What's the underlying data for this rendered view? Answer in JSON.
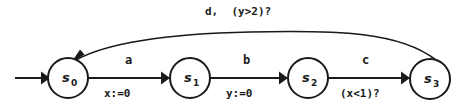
{
  "diagram": {
    "background_color": "#ffffff",
    "stroke_color": "#1a1a1a",
    "states": [
      {
        "id": "s0",
        "base": "s",
        "subscript": "0",
        "cx": 68,
        "cy": 78,
        "r": 20,
        "initial": true
      },
      {
        "id": "s1",
        "base": "s",
        "subscript": "1",
        "cx": 190,
        "cy": 78,
        "r": 20,
        "initial": false
      },
      {
        "id": "s2",
        "base": "s",
        "subscript": "2",
        "cx": 308,
        "cy": 78,
        "r": 20,
        "initial": false
      },
      {
        "id": "s3",
        "base": "s",
        "subscript": "3",
        "cx": 430,
        "cy": 79,
        "r": 20,
        "initial": false
      }
    ],
    "transitions": [
      {
        "id": "t-init",
        "from": null,
        "to": "s0",
        "kind": "initial",
        "action": "",
        "guard": "",
        "assignment": ""
      },
      {
        "id": "t-s0-s1",
        "from": "s0",
        "to": "s1",
        "kind": "straight",
        "action": "a",
        "assignment": "x:=0",
        "guard": ""
      },
      {
        "id": "t-s1-s2",
        "from": "s1",
        "to": "s2",
        "kind": "straight",
        "action": "b",
        "assignment": "y:=0",
        "guard": ""
      },
      {
        "id": "t-s2-s3",
        "from": "s2",
        "to": "s3",
        "kind": "straight",
        "action": "c",
        "assignment": "",
        "guard": "(x<1)?"
      },
      {
        "id": "t-s3-s0",
        "from": "s3",
        "to": "s0",
        "kind": "curved",
        "action": "d,",
        "guard": "(y>2)?",
        "assignment": "",
        "label": "d,  (y>2)?"
      }
    ],
    "labels": {
      "feedback": "d,  (y>2)?",
      "a": "a",
      "b": "b",
      "c": "c",
      "x_assign": "x:=0",
      "y_assign": "y:=0",
      "x_guard": "(x<1)?"
    }
  }
}
